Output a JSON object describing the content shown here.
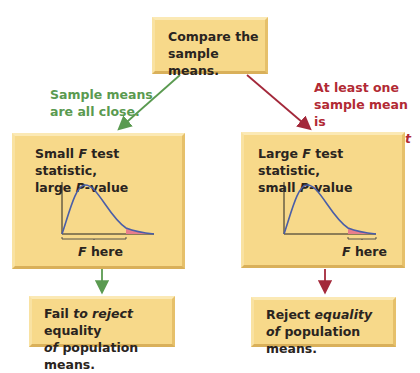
{
  "top_box": {
    "line1": "Compare the",
    "line2": "sample means."
  },
  "left_branch": {
    "note_line1": "Sample means",
    "note_line2": "are all close.",
    "box_line1_a": "Small ",
    "box_line1_f": "F",
    "box_line1_b": " test statistic,",
    "box_line2_a": "large ",
    "box_line2_p": "P",
    "box_line2_b": "-value",
    "f_label_f": "F",
    "f_label_rest": " here",
    "result_line1_a": "Fail ",
    "result_line1_it": "to reject",
    "result_line1_b": " equality",
    "result_line2_it": "of",
    "result_line2_b": " population means."
  },
  "right_branch": {
    "note_line1": "At least one",
    "note_line2": "sample mean is",
    "note_line3": "very different",
    "box_line1_a": "Large ",
    "box_line1_f": "F",
    "box_line1_b": " test statistic,",
    "box_line2_a": "small ",
    "box_line2_p": "P",
    "box_line2_b": "-value",
    "f_label_f": "F",
    "f_label_rest": " here",
    "result_line1_a": "Reject ",
    "result_line1_it": "equality",
    "result_line2_it": "of",
    "result_line2_b": " population means."
  },
  "colors": {
    "box_fill": "#f7d98a",
    "green_arrow": "#5a9a50",
    "red_arrow": "#a3283a",
    "curve": "#4a5ea8",
    "tail_fill": "#e87e8c"
  }
}
